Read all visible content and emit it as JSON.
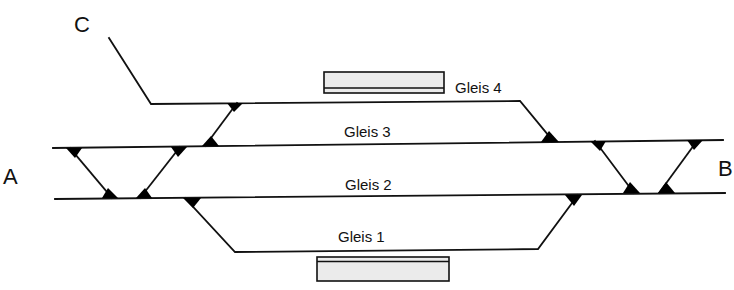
{
  "diagram": {
    "type": "track-layout",
    "endpoints": [
      {
        "id": "A",
        "label": "A",
        "x": 3,
        "y": 184
      },
      {
        "id": "B",
        "label": "B",
        "x": 718,
        "y": 176
      },
      {
        "id": "C",
        "label": "C",
        "x": 74,
        "y": 32
      }
    ],
    "tracks": [
      {
        "id": "gleis-4",
        "label": "Gleis 4",
        "label_x": 455,
        "label_y": 93
      },
      {
        "id": "gleis-3",
        "label": "Gleis 3",
        "label_x": 344,
        "label_y": 137
      },
      {
        "id": "gleis-2",
        "label": "Gleis 2",
        "label_x": 345,
        "label_y": 190
      },
      {
        "id": "gleis-1",
        "label": "Gleis 1",
        "label_x": 338,
        "label_y": 242
      }
    ],
    "platforms": [
      {
        "id": "platform-gleis-4",
        "track": "Gleis 4"
      },
      {
        "id": "platform-gleis-1",
        "track": "Gleis 1"
      }
    ],
    "colors": {
      "line": "#111111",
      "platform_fill": "#ebebeb",
      "background": "#ffffff"
    }
  }
}
